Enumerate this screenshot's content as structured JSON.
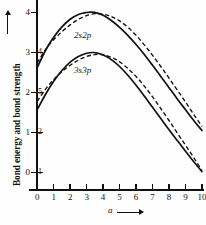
{
  "chart_data": {
    "type": "line",
    "title": "",
    "xlabel": "a",
    "ylabel": "Bond energy and bond strength",
    "xlim": [
      0,
      10
    ],
    "ylim": [
      -0.35,
      4.35
    ],
    "grid": false,
    "legend": "inline-curve-labels",
    "x_ticks": [
      "0",
      "1",
      "2",
      "3",
      "4",
      "5",
      "6",
      "7",
      "8",
      "9",
      "10"
    ],
    "x_tick_values": [
      0,
      1,
      2,
      3,
      4,
      5,
      6,
      7,
      8,
      9,
      10
    ],
    "y_ticks_outer": [
      "0",
      "1",
      "2",
      "3",
      "4"
    ],
    "y_tick_values_outer": [
      0,
      1,
      2,
      3,
      4
    ],
    "y_ticks_inner": [
      "1",
      "2",
      "4",
      "5"
    ],
    "y_tick_values_inner": [
      0,
      1,
      3,
      2
    ],
    "series": [
      {
        "name": "2s2p",
        "style": "solid",
        "x": [
          0,
          0.5,
          1,
          1.5,
          2,
          2.5,
          3,
          3.3,
          3.6,
          4,
          4.5,
          5,
          5.5,
          6,
          6.5,
          7,
          7.5,
          8,
          8.5,
          9,
          9.5,
          10
        ],
        "values": [
          2.62,
          3.05,
          3.38,
          3.64,
          3.83,
          3.95,
          4.0,
          4.01,
          3.99,
          3.93,
          3.8,
          3.63,
          3.43,
          3.2,
          2.95,
          2.68,
          2.4,
          2.12,
          1.84,
          1.57,
          1.3,
          1.05
        ]
      },
      {
        "name": "2s2p",
        "style": "dashed",
        "x": [
          0,
          0.5,
          1,
          1.5,
          2,
          2.5,
          3,
          3.5,
          3.8,
          4.2,
          4.6,
          5,
          5.5,
          6,
          6.5,
          7,
          7.5,
          8,
          8.5,
          9,
          9.5,
          10
        ],
        "values": [
          2.74,
          3.07,
          3.32,
          3.52,
          3.69,
          3.83,
          3.92,
          3.97,
          3.97,
          3.94,
          3.88,
          3.79,
          3.63,
          3.43,
          3.19,
          2.93,
          2.65,
          2.36,
          2.06,
          1.76,
          1.45,
          1.15
        ]
      },
      {
        "name": "3s3p",
        "style": "solid",
        "x": [
          0,
          0.5,
          1,
          1.5,
          2,
          2.5,
          3,
          3.4,
          3.8,
          4.2,
          4.6,
          5,
          5.5,
          6,
          6.5,
          7,
          7.5,
          8,
          8.5,
          9,
          9.5,
          10
        ],
        "values": [
          1.57,
          1.95,
          2.28,
          2.55,
          2.76,
          2.9,
          2.98,
          3.0,
          2.97,
          2.9,
          2.79,
          2.65,
          2.43,
          2.18,
          1.91,
          1.63,
          1.35,
          1.07,
          0.8,
          0.53,
          0.27,
          0.02
        ]
      },
      {
        "name": "3s3p",
        "style": "dashed",
        "x": [
          0,
          0.5,
          1,
          1.5,
          2,
          2.5,
          3,
          3.5,
          3.9,
          4.3,
          4.7,
          5,
          5.5,
          6,
          6.5,
          7,
          7.5,
          8,
          8.5,
          9,
          9.5,
          10
        ],
        "values": [
          1.78,
          2.08,
          2.32,
          2.52,
          2.68,
          2.81,
          2.9,
          2.95,
          2.95,
          2.91,
          2.84,
          2.77,
          2.6,
          2.4,
          2.16,
          1.89,
          1.6,
          1.3,
          0.99,
          0.68,
          0.37,
          0.05
        ]
      }
    ]
  },
  "labels": {
    "y_axis_title": "Bond energy and bond strength",
    "x_axis_title": "a",
    "curve_upper": "2s2p",
    "curve_lower": "3s3p"
  },
  "colors": {
    "ink": "#14100e",
    "background": "#fefefe"
  }
}
